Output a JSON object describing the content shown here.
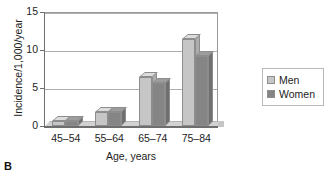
{
  "panel": {
    "letter": "B"
  },
  "chart_data": {
    "type": "bar",
    "title": "",
    "xlabel": "Age, years",
    "ylabel": "Incidence/1,000/year",
    "categories": [
      "45–54",
      "55–64",
      "65–74",
      "75–84"
    ],
    "series": [
      {
        "name": "Men",
        "color": "#c6c6c6",
        "values": [
          0.6,
          1.9,
          6.5,
          11.5
        ]
      },
      {
        "name": "Women",
        "color": "#858585",
        "values": [
          0.7,
          1.8,
          5.6,
          9.2
        ]
      }
    ],
    "ylim": [
      0,
      15
    ],
    "yticks": [
      0,
      5,
      10,
      15
    ],
    "ytick_labels": [
      "0",
      "5",
      "10",
      "15"
    ],
    "grid": true,
    "legend_position": "right",
    "style": "3d-column"
  },
  "legend": {
    "items": [
      {
        "label": "Men",
        "swatch": "men-swatch"
      },
      {
        "label": "Women",
        "swatch": "women-swatch"
      }
    ]
  },
  "top_remnant": {
    "text": ""
  }
}
